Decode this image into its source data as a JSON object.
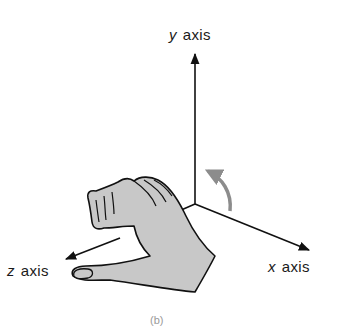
{
  "figure": {
    "type": "right-hand rule coordinate diagram",
    "axes": {
      "y": {
        "variable": "y",
        "word": "axis"
      },
      "x": {
        "variable": "x",
        "word": "axis"
      },
      "z": {
        "variable": "z",
        "word": "axis"
      }
    },
    "rotation_arrow": {
      "color": "#8c8c8c",
      "direction": "from x axis toward y axis"
    },
    "hand": {
      "fill": "#c8c8c8",
      "stroke": "#111111",
      "description": "right hand, thumb pointing along z axis, fingers curled"
    },
    "caption": "(b)"
  }
}
